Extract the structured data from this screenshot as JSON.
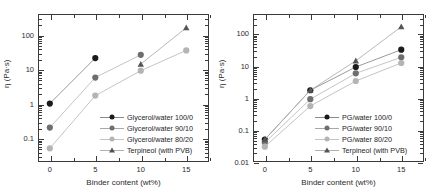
{
  "figure": {
    "panels": [
      "left",
      "right"
    ]
  },
  "chart_data": [
    {
      "type": "line",
      "panel": "left",
      "title": "",
      "xlabel": "Binder content (wt%)",
      "ylabel": "η (Pa·s)",
      "xlim": [
        -1.3,
        17.5
      ],
      "ylim": [
        0.02,
        400
      ],
      "yscale": "log",
      "xscale": "linear",
      "grid": false,
      "legend_position": "lower-right inside axes",
      "xticks": [
        0,
        5,
        10,
        15
      ],
      "xtick_labels": [
        "0",
        "5",
        "10",
        "15"
      ],
      "yticks": [
        0.1,
        1,
        10,
        100
      ],
      "ytick_labels": [
        "0.1",
        "1",
        "10",
        "100"
      ],
      "series": [
        {
          "name": "Glycerol/water 100/0",
          "marker": "circle",
          "color": "#1a1a1a",
          "x": [
            0,
            5
          ],
          "values": [
            1.0,
            21.0
          ]
        },
        {
          "name": "Glycerol/water 90/10",
          "marker": "circle",
          "color": "#6e6e6e",
          "x": [
            0,
            5,
            10
          ],
          "values": [
            0.2,
            5.7,
            26.0
          ]
        },
        {
          "name": "Glycerol/water 80/20",
          "marker": "circle",
          "color": "#b4b4b4",
          "x": [
            0,
            5,
            10,
            15
          ],
          "values": [
            0.05,
            1.7,
            9.0,
            35.0
          ]
        },
        {
          "name": "Terpineol (with PVB)",
          "marker": "triangle",
          "color": "#555555",
          "x": [
            10,
            15
          ],
          "values": [
            14.0,
            160.0
          ]
        }
      ]
    },
    {
      "type": "line",
      "panel": "right",
      "title": "",
      "xlabel": "Binder content (wt%)",
      "ylabel": "η (Pa·s)",
      "xlim": [
        -1.3,
        17.5
      ],
      "ylim": [
        0.01,
        400
      ],
      "yscale": "log",
      "xscale": "linear",
      "grid": false,
      "legend_position": "lower-right inside axes",
      "xticks": [
        0,
        5,
        10,
        15
      ],
      "xtick_labels": [
        "0",
        "5",
        "10",
        "15"
      ],
      "yticks": [
        0.01,
        0.1,
        1,
        10,
        100
      ],
      "ytick_labels": [
        "0.01",
        "0.1",
        "1",
        "10",
        "100"
      ],
      "series": [
        {
          "name": "PG/water 100/0",
          "marker": "circle",
          "color": "#1a1a1a",
          "x": [
            0,
            5,
            10,
            15
          ],
          "values": [
            0.05,
            1.7,
            9.0,
            31.0
          ]
        },
        {
          "name": "PG/water 90/10",
          "marker": "circle",
          "color": "#6e6e6e",
          "x": [
            0,
            5,
            10,
            15
          ],
          "values": [
            0.04,
            0.9,
            5.7,
            18.0
          ]
        },
        {
          "name": "PG/water 80/20",
          "marker": "circle",
          "color": "#b4b4b4",
          "x": [
            0,
            5,
            10,
            15
          ],
          "values": [
            0.03,
            0.55,
            3.3,
            12.0
          ]
        },
        {
          "name": "Terpineol (with PVB)",
          "marker": "triangle",
          "color": "#555555",
          "x": [
            0,
            5,
            10,
            15
          ],
          "values": [
            0.05,
            1.7,
            14.0,
            160.0
          ]
        }
      ]
    }
  ]
}
